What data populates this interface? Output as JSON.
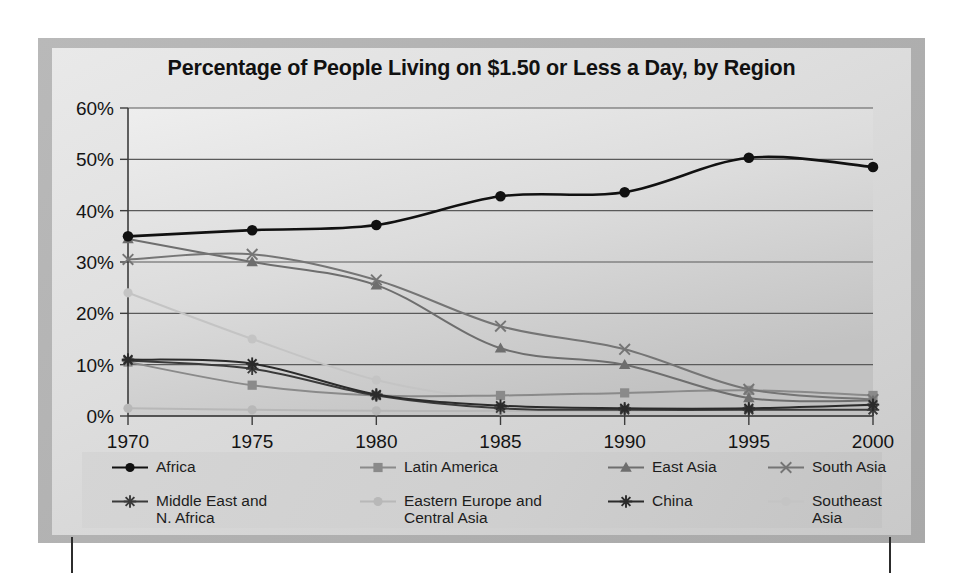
{
  "chart_data": {
    "type": "line",
    "title": "Percentage of People Living on $1.50 or Less a Day, by Region",
    "xlabel": "",
    "ylabel": "",
    "x": [
      1970,
      1975,
      1980,
      1985,
      1990,
      1995,
      2000
    ],
    "xtick_labels": [
      "1970",
      "1975",
      "1980",
      "1985",
      "1990",
      "1995",
      "2000"
    ],
    "ytick_labels": [
      "0%",
      "10%",
      "20%",
      "30%",
      "40%",
      "50%",
      "60%"
    ],
    "yticks": [
      0,
      10,
      20,
      30,
      40,
      50,
      60
    ],
    "ylim": [
      0,
      60
    ],
    "xlim": [
      1970,
      2000
    ],
    "grid": "horizontal",
    "legend_position": "bottom",
    "smoothing": "spline",
    "series": [
      {
        "name": "Africa",
        "marker": "circle",
        "color": "#111111",
        "values": [
          35.0,
          36.2,
          37.2,
          42.8,
          43.6,
          50.3,
          48.5
        ]
      },
      {
        "name": "Latin America",
        "marker": "square",
        "color": "#8a8a8a",
        "values": [
          10.5,
          6.0,
          4.0,
          4.0,
          4.5,
          5.0,
          4.0
        ]
      },
      {
        "name": "East Asia",
        "marker": "triangle",
        "color": "#6e6e6e",
        "values": [
          34.5,
          30.0,
          25.5,
          13.2,
          10.0,
          3.5,
          3.0
        ]
      },
      {
        "name": "South Asia",
        "marker": "x",
        "color": "#757575",
        "values": [
          30.5,
          31.5,
          26.5,
          17.5,
          13.0,
          5.2,
          3.2
        ]
      },
      {
        "name": "Middle East and\nN. Africa",
        "marker": "asterisk",
        "color": "#3a3a3a",
        "values": [
          10.8,
          9.2,
          4.0,
          1.5,
          1.2,
          1.2,
          1.2
        ]
      },
      {
        "name": "Eastern Europe and\nCentral Asia",
        "marker": "circle",
        "color": "#b8b8b8",
        "values": [
          1.5,
          1.2,
          1.0,
          1.0,
          1.0,
          1.5,
          2.0
        ]
      },
      {
        "name": "China",
        "marker": "star",
        "color": "#2b2b2b",
        "values": [
          11.0,
          10.2,
          4.2,
          2.0,
          1.5,
          1.5,
          2.2
        ]
      },
      {
        "name": "Southeast\nAsia",
        "marker": "circle",
        "color": "#c4c4c4",
        "values": [
          24.0,
          15.0,
          7.0,
          3.0,
          1.5,
          1.2,
          1.5
        ]
      }
    ]
  },
  "legend": {
    "items": [
      {
        "label": "Africa",
        "marker": "circle",
        "color": "#111111"
      },
      {
        "label": "Latin America",
        "marker": "square",
        "color": "#8a8a8a"
      },
      {
        "label": "East Asia",
        "marker": "triangle",
        "color": "#6e6e6e"
      },
      {
        "label": "South Asia",
        "marker": "x",
        "color": "#757575"
      },
      {
        "label": "Middle East and\nN. Africa",
        "marker": "asterisk",
        "color": "#3a3a3a"
      },
      {
        "label": "Eastern Europe and\nCentral Asia",
        "marker": "circle",
        "color": "#b8b8b8"
      },
      {
        "label": "China",
        "marker": "star",
        "color": "#2b2b2b"
      },
      {
        "label": "Southeast\nAsia",
        "marker": "circle",
        "color": "#c4c4c4"
      }
    ]
  },
  "style": {
    "axis_color": "#3c3c3c",
    "grid_color": "#5a5a5a",
    "tick_text_color": "#141414",
    "frame_color": "#b3b3b3"
  }
}
